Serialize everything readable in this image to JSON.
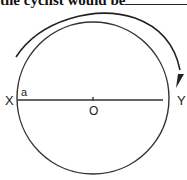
{
  "caption": {
    "text": "the cyclist would be",
    "suffix": "."
  },
  "diagram": {
    "labels": {
      "left_point": "X",
      "right_point": "Y",
      "center": "O",
      "angle": "a"
    }
  }
}
